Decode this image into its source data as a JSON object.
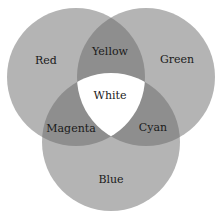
{
  "diagram": {
    "type": "venn",
    "title": "",
    "colors": {
      "single": "#b4b4b4",
      "pair": "#8e8e8e",
      "triple": "#ffffff",
      "background": "#ffffff",
      "text": "#1a1a1a"
    },
    "circles": [
      {
        "id": "red",
        "label": "Red",
        "cx": 76,
        "cy": 77,
        "r": 69
      },
      {
        "id": "green",
        "label": "Green",
        "cx": 146,
        "cy": 77,
        "r": 69
      },
      {
        "id": "blue",
        "label": "Blue",
        "cx": 111,
        "cy": 142,
        "r": 69
      }
    ],
    "labels": {
      "red": "Red",
      "green": "Green",
      "blue": "Blue",
      "yellow": "Yellow",
      "magenta": "Magenta",
      "cyan": "Cyan",
      "white": "White"
    },
    "regions": [
      {
        "sets": [
          "red"
        ],
        "label": "Red"
      },
      {
        "sets": [
          "green"
        ],
        "label": "Green"
      },
      {
        "sets": [
          "blue"
        ],
        "label": "Blue"
      },
      {
        "sets": [
          "red",
          "green"
        ],
        "label": "Yellow"
      },
      {
        "sets": [
          "red",
          "blue"
        ],
        "label": "Magenta"
      },
      {
        "sets": [
          "green",
          "blue"
        ],
        "label": "Cyan"
      },
      {
        "sets": [
          "red",
          "green",
          "blue"
        ],
        "label": "White"
      }
    ]
  }
}
